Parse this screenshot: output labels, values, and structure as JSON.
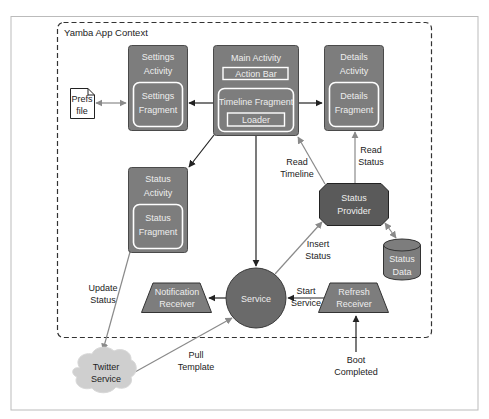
{
  "context_label": "Yamba App Context",
  "colors": {
    "box_fill": "#7d7d7d",
    "box_stroke": "#4a4a4a",
    "dark_fill": "#5a5a5a",
    "inner_stroke": "#ffffff",
    "cloud_fill": "#cfcfcf",
    "arrow_black": "#222222",
    "arrow_gray": "#8a8a8a",
    "frame": "#bbbbbb"
  },
  "nodes": {
    "settings_activity": {
      "line1": "Settings",
      "line2": "Activity"
    },
    "settings_fragment": {
      "line1": "Settings",
      "line2": "Fragment"
    },
    "main_activity": {
      "title": "Main Activity",
      "action_bar": "Action Bar",
      "timeline_fragment": "Timeline Fragment",
      "loader": "Loader"
    },
    "details_activity": {
      "line1": "Details",
      "line2": "Activity"
    },
    "details_fragment": {
      "line1": "Details",
      "line2": "Fragment"
    },
    "prefs_file": {
      "line1": "Prefs",
      "line2": "file"
    },
    "status_activity": {
      "line1": "Status",
      "line2": "Activity"
    },
    "status_fragment": {
      "line1": "Status",
      "line2": "Fragment"
    },
    "status_provider": {
      "line1": "Status",
      "line2": "Provider"
    },
    "status_data": {
      "line1": "Status",
      "line2": "Data"
    },
    "service": {
      "label": "Service"
    },
    "notification_receiver": {
      "line1": "Notification",
      "line2": "Receiver"
    },
    "refresh_receiver": {
      "line1": "Refresh",
      "line2": "Receiver"
    },
    "twitter_service": {
      "line1": "Twitter",
      "line2": "Service"
    }
  },
  "edges": {
    "read_timeline": {
      "line1": "Read",
      "line2": "Timeline"
    },
    "read_status": {
      "line1": "Read",
      "line2": "Status"
    },
    "insert_status": {
      "line1": "Insert",
      "line2": "Status"
    },
    "update_status": {
      "line1": "Update",
      "line2": "Status"
    },
    "start_service": {
      "line1": "Start",
      "line2": "Service"
    },
    "pull_template": {
      "line1": "Pull",
      "line2": "Template"
    },
    "boot_completed": {
      "line1": "Boot",
      "line2": "Completed"
    }
  }
}
